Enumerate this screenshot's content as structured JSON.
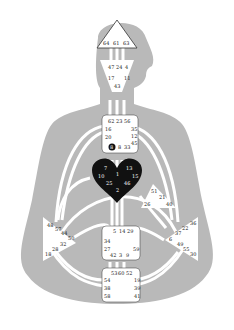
{
  "chart_title": "Human Design Bodygraph",
  "colors": {
    "body": "#b9b9b9",
    "channel": "#ffffff",
    "center_open": "#ffffff",
    "center_defined": "#111111",
    "outline": "#333333"
  },
  "centers": {
    "head": {
      "gates": [
        "64",
        "61",
        "63"
      ]
    },
    "ajna": {
      "gates": [
        "47",
        "24",
        "4",
        "17",
        "11",
        "43"
      ]
    },
    "throat": {
      "gates": [
        "62",
        "23",
        "56",
        "16",
        "20",
        "35",
        "12",
        "45",
        "8",
        "33"
      ]
    },
    "heart": {
      "gates": [
        "7",
        "1",
        "13",
        "10",
        "15",
        "25",
        "46",
        "2"
      ]
    },
    "ego": {
      "gates": [
        "51",
        "21",
        "26",
        "40"
      ]
    },
    "spleen": {
      "gates": [
        "48",
        "57",
        "44",
        "50",
        "32",
        "28",
        "18"
      ]
    },
    "solar_plexus": {
      "gates": [
        "36",
        "22",
        "37",
        "6",
        "49",
        "55",
        "30"
      ]
    },
    "sacral": {
      "gates": [
        "5",
        "14",
        "29",
        "34",
        "27",
        "59",
        "42",
        "3",
        "9"
      ]
    },
    "root": {
      "gates": [
        "53",
        "60",
        "52",
        "54",
        "19",
        "38",
        "39",
        "58",
        "41"
      ]
    }
  }
}
